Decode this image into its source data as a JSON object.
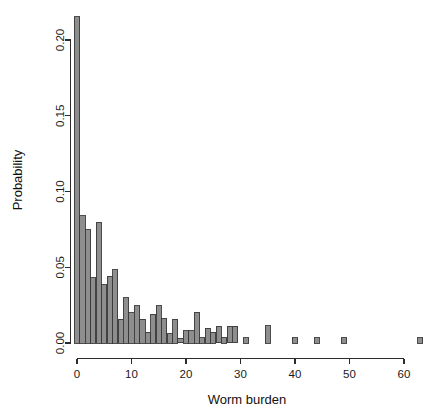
{
  "chart_data": {
    "type": "bar",
    "title": "",
    "subtitle": "",
    "xlabel": "Worm burden",
    "ylabel": "Probability",
    "xlim": [
      -0.5,
      64.5
    ],
    "ylim": [
      0.0,
      0.215
    ],
    "grid": false,
    "legend": null,
    "legend_position": "none",
    "bar_fill_color": "#8e8e8e",
    "bar_border_color": "#3a3a3a",
    "axis_color": "#2b2b2b",
    "background_color": "#ffffff",
    "xticks": [
      0,
      10,
      20,
      30,
      40,
      50,
      60
    ],
    "xtick_labels": [
      "0",
      "10",
      "20",
      "30",
      "40",
      "50",
      "60"
    ],
    "yticks": [
      0.0,
      0.05,
      0.1,
      0.15,
      0.2
    ],
    "ytick_labels": [
      "0.00",
      "0.05",
      "0.10",
      "0.15",
      "0.20"
    ],
    "categories": [
      0,
      1,
      2,
      3,
      4,
      5,
      6,
      7,
      8,
      9,
      10,
      11,
      12,
      13,
      14,
      15,
      16,
      17,
      18,
      19,
      20,
      21,
      22,
      23,
      24,
      25,
      26,
      27,
      28,
      29,
      30,
      31,
      32,
      33,
      34,
      35,
      36,
      40,
      44,
      49,
      63
    ],
    "values": [
      0.2155,
      0.084,
      0.0748,
      0.0432,
      0.0798,
      0.0386,
      0.0442,
      0.0484,
      0.0158,
      0.03,
      0.02,
      0.0246,
      0.0158,
      0.007,
      0.019,
      0.0245,
      0.0165,
      0.006,
      0.0157,
      0.003,
      0.008,
      0.0082,
      0.0203,
      0.0035,
      0.0098,
      0.007,
      0.011,
      0.0035,
      0.011,
      0.011,
      0.0,
      0.0035,
      0.0,
      0.0,
      0.0,
      0.0113,
      0.0,
      0.0035,
      0.0035,
      0.0035,
      0.0035
    ]
  },
  "labels": {
    "y_axis_title": "Probability",
    "x_axis_title": "Worm burden"
  }
}
